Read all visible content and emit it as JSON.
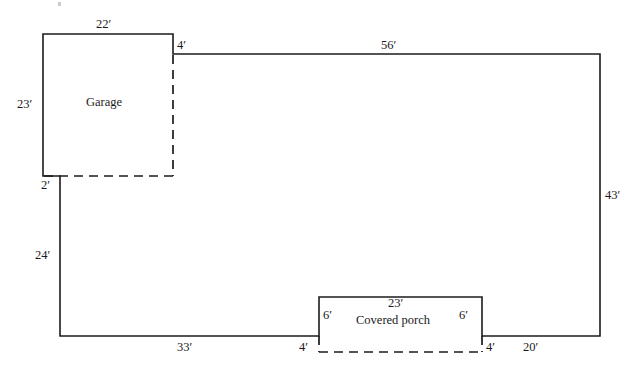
{
  "diagram": {
    "units": "feet",
    "line_color": "#1c1c1c",
    "background_color": "#ffffff"
  },
  "rooms": [
    {
      "id": "garage",
      "label": "Garage"
    },
    {
      "id": "covered_porch",
      "label": "Covered porch"
    }
  ],
  "dimensions": {
    "garage_top": "22′",
    "garage_left": "23′",
    "garage_offset_top": "4′",
    "garage_offset_bottom": "2′",
    "main_top": "56′",
    "main_right": "43′",
    "left_lower": "24′",
    "bottom_left_run": "33′",
    "porch_left_step": "4′",
    "porch_left_side": "6′",
    "porch_top": "23′",
    "porch_right_side": "6′",
    "porch_right_step": "4′",
    "bottom_right_run": "20′"
  },
  "geometry": {
    "solid_outline": "M 43 34 L 173 34 L 173 54 L 600 54 L 600 336 L 482 336 L 482 297 L 319 297 L 319 336 L 60 336 L 60 176 L 43 176 L 43 34",
    "dashed_garage_right": "M 173 55 L 173 176",
    "dashed_garage_bottom": "M 44 176 L 174 176",
    "dashed_porch_left_step": "M 319 336 L 319 352",
    "dashed_porch_bottom": "M 319 352 L 482 352",
    "dashed_porch_right_step": "M 482 336 L 482 352"
  },
  "label_positions": {
    "garage_top": {
      "x": 96,
      "y": 18
    },
    "garage_left": {
      "x": 17,
      "y": 98
    },
    "garage_offset_top": {
      "x": 177,
      "y": 39
    },
    "garage_offset_bottom": {
      "x": 41,
      "y": 179
    },
    "main_top": {
      "x": 381,
      "y": 39
    },
    "main_right": {
      "x": 605,
      "y": 189
    },
    "left_lower": {
      "x": 35,
      "y": 249
    },
    "bottom_left_run": {
      "x": 177,
      "y": 341
    },
    "porch_left_step": {
      "x": 299,
      "y": 341
    },
    "porch_left_side": {
      "x": 323,
      "y": 309
    },
    "porch_top": {
      "x": 388,
      "y": 297
    },
    "porch_right_side": {
      "x": 459,
      "y": 309
    },
    "porch_right_step": {
      "x": 486,
      "y": 341
    },
    "bottom_right_run": {
      "x": 523,
      "y": 341
    },
    "garage_room": {
      "x": 86,
      "y": 96
    },
    "porch_room": {
      "x": 356,
      "y": 314
    }
  }
}
